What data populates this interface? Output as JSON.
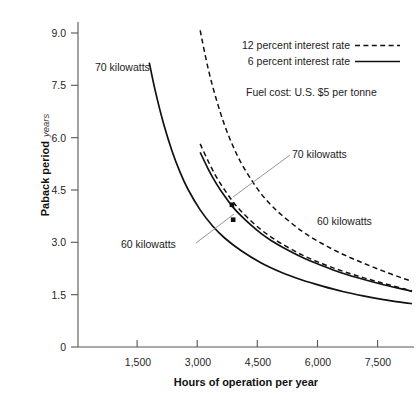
{
  "chart_data": {
    "type": "line",
    "title": "",
    "xlabel": "Hours of operation per year",
    "ylabel": "Paback period",
    "ylabel_sub": "years",
    "xlim": [
      0,
      8250
    ],
    "ylim": [
      0,
      9.6
    ],
    "grid": false,
    "xticks": [
      1500,
      3000,
      4500,
      6000,
      7500
    ],
    "xtick_labels": [
      "1,500",
      "3,000",
      "4,500",
      "6,000",
      "7,500"
    ],
    "yticks": [
      0,
      1.5,
      3.0,
      4.5,
      6.0,
      7.5,
      9.0
    ],
    "ytick_labels": [
      "0",
      "1.5",
      "3.0",
      "4.5",
      "6.0",
      "7.5",
      "9.0"
    ],
    "legend_position": "top-right",
    "legend": [
      {
        "label": "12 percent interest rate",
        "style": "dashed"
      },
      {
        "label": "6 percent interest rate",
        "style": "solid"
      }
    ],
    "note": "Fuel cost: U.S. $5 per tonne",
    "series": [
      {
        "name": "70 kilowatts, 12 percent interest rate",
        "style": "dashed",
        "points": [
          [
            3000,
            9.35
          ],
          [
            3200,
            8.2
          ],
          [
            3400,
            7.3
          ],
          [
            3600,
            6.55
          ],
          [
            3800,
            5.95
          ],
          [
            4000,
            5.45
          ],
          [
            4250,
            4.95
          ],
          [
            4500,
            4.52
          ],
          [
            4750,
            4.18
          ],
          [
            5000,
            3.9
          ],
          [
            5500,
            3.42
          ],
          [
            6000,
            3.05
          ],
          [
            6500,
            2.74
          ],
          [
            7000,
            2.48
          ],
          [
            7500,
            2.24
          ],
          [
            8000,
            2.02
          ],
          [
            8200,
            1.94
          ]
        ]
      },
      {
        "name": "60 kilowatts, 12 percent interest rate",
        "style": "dashed",
        "points": [
          [
            3000,
            6.0
          ],
          [
            3200,
            5.48
          ],
          [
            3400,
            5.02
          ],
          [
            3600,
            4.64
          ],
          [
            3800,
            4.3
          ],
          [
            4000,
            4.02
          ],
          [
            4250,
            3.72
          ],
          [
            4500,
            3.46
          ],
          [
            4750,
            3.24
          ],
          [
            5000,
            3.05
          ],
          [
            5500,
            2.72
          ],
          [
            6000,
            2.46
          ],
          [
            6500,
            2.24
          ],
          [
            7000,
            2.05
          ],
          [
            7500,
            1.88
          ],
          [
            8000,
            1.72
          ],
          [
            8200,
            1.66
          ]
        ]
      },
      {
        "name": "70 kilowatts, 6 percent interest rate",
        "style": "solid",
        "points": [
          [
            1750,
            8.4
          ],
          [
            1900,
            7.55
          ],
          [
            2100,
            6.6
          ],
          [
            2300,
            5.82
          ],
          [
            2500,
            5.18
          ],
          [
            2700,
            4.66
          ],
          [
            3000,
            4.05
          ],
          [
            3300,
            3.58
          ],
          [
            3600,
            3.22
          ],
          [
            4000,
            2.85
          ],
          [
            4500,
            2.48
          ],
          [
            5000,
            2.2
          ],
          [
            5500,
            1.98
          ],
          [
            6000,
            1.8
          ],
          [
            6500,
            1.64
          ],
          [
            7000,
            1.51
          ],
          [
            7500,
            1.4
          ],
          [
            8000,
            1.31
          ],
          [
            8200,
            1.28
          ]
        ]
      },
      {
        "name": "60 kilowatts, 6 percent interest rate",
        "style": "solid",
        "points": [
          [
            3000,
            5.75
          ],
          [
            3200,
            5.25
          ],
          [
            3400,
            4.82
          ],
          [
            3600,
            4.46
          ],
          [
            3800,
            4.14
          ],
          [
            4000,
            3.88
          ],
          [
            4250,
            3.6
          ],
          [
            4500,
            3.35
          ],
          [
            4750,
            3.14
          ],
          [
            5000,
            2.96
          ],
          [
            5500,
            2.65
          ],
          [
            6000,
            2.4
          ],
          [
            6500,
            2.18
          ],
          [
            7000,
            2.0
          ],
          [
            7500,
            1.84
          ],
          [
            8000,
            1.7
          ],
          [
            8200,
            1.64
          ]
        ]
      }
    ],
    "markers": [
      {
        "x": 3780,
        "y": 4.2,
        "label": "70 kilowatts"
      },
      {
        "x": 3810,
        "y": 3.76,
        "label": "60 kilowatts"
      }
    ],
    "annotations": [
      {
        "label": "70 kilowatts",
        "x": 1400,
        "y": 8.1,
        "role": "curve-label-left"
      },
      {
        "label": "70 kilowatts",
        "x": 5300,
        "y": 5.05,
        "role": "callout-upper"
      },
      {
        "label": "60 kilowatts",
        "x": 2750,
        "y": 2.55,
        "role": "callout-lower"
      },
      {
        "label": "60 kilowatts",
        "x": 6450,
        "y": 3.05,
        "role": "curve-label-right"
      }
    ]
  }
}
